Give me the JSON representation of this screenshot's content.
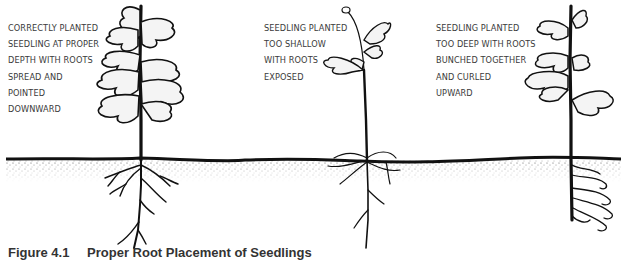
{
  "figure": {
    "caption_number": "Figure 4.1",
    "caption_title": "Proper Root Placement of Seedlings",
    "panels": [
      {
        "id": "correct",
        "lines": [
          "Correctly planted",
          "seedling at proper",
          "depth with roots",
          "spread and",
          "pointed",
          "downward"
        ]
      },
      {
        "id": "shallow",
        "lines": [
          "Seedling planted",
          "too shallow",
          "with roots",
          "exposed"
        ]
      },
      {
        "id": "deep",
        "lines": [
          "Seedling planted",
          "too deep with roots",
          "bunched together",
          "and curled",
          "upward"
        ]
      }
    ],
    "colors": {
      "ink": "#111111",
      "text": "#3a3a3a",
      "soil_stipple": "#555555",
      "background": "#ffffff"
    }
  }
}
